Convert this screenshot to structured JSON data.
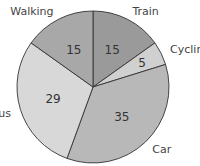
{
  "chart_data": {
    "type": "pie",
    "title": "",
    "categories": [
      "Train",
      "Cycling",
      "Car",
      "Bus",
      "Walking"
    ],
    "values": [
      15,
      5,
      35,
      29,
      15
    ],
    "colors": [
      "#9a9a9a",
      "#d0d0d0",
      "#b8b8b8",
      "#d8d8d8",
      "#a8a8a8"
    ],
    "start_angle_deg": 0,
    "direction": "clockwise",
    "data_labels": true,
    "legend": "none"
  }
}
